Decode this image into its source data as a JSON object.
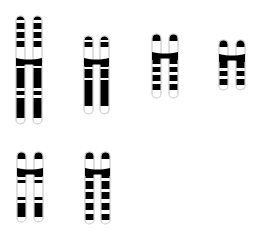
{
  "figure": {
    "background_color": "#ffffff",
    "band_color": "#000000",
    "outline_color": "#d8d8d8",
    "interband_color": "#ffffff",
    "canvas": {
      "width": 268,
      "height": 240
    },
    "rows": [
      {
        "name": "top-row",
        "count": 4
      },
      {
        "name": "bottom-row",
        "count": 2
      }
    ]
  },
  "chromosomes": [
    {
      "id": "chromosome-1",
      "name": "chromosome-1",
      "row": "top-row",
      "index": 1,
      "x": 16,
      "y": 16,
      "chromatid_width": 9,
      "gap": 8,
      "p_arm_length": 46,
      "q_arm_length": 62,
      "centromere_y": 62,
      "bands_p": [
        {
          "start": 0,
          "end": 4,
          "shade": "dark"
        },
        {
          "start": 4,
          "end": 7,
          "shade": "light"
        },
        {
          "start": 7,
          "end": 13,
          "shade": "dark"
        },
        {
          "start": 13,
          "end": 16,
          "shade": "light"
        },
        {
          "start": 16,
          "end": 22,
          "shade": "dark"
        },
        {
          "start": 22,
          "end": 25,
          "shade": "light"
        },
        {
          "start": 25,
          "end": 31,
          "shade": "dark"
        },
        {
          "start": 31,
          "end": 46,
          "shade": "light"
        }
      ],
      "bands_q": [
        {
          "start": 0,
          "end": 4,
          "shade": "dark"
        },
        {
          "start": 4,
          "end": 6,
          "shade": "light"
        },
        {
          "start": 6,
          "end": 26,
          "shade": "dark"
        },
        {
          "start": 26,
          "end": 29,
          "shade": "light"
        },
        {
          "start": 29,
          "end": 33,
          "shade": "dark"
        },
        {
          "start": 33,
          "end": 36,
          "shade": "light"
        },
        {
          "start": 36,
          "end": 56,
          "shade": "dark"
        },
        {
          "start": 56,
          "end": 62,
          "shade": "light"
        }
      ]
    },
    {
      "id": "chromosome-2",
      "name": "chromosome-2",
      "row": "top-row",
      "index": 2,
      "x": 84,
      "y": 36,
      "chromatid_width": 9,
      "gap": 7,
      "p_arm_length": 26,
      "q_arm_length": 52,
      "centromere_y": 62,
      "bands_p": [
        {
          "start": 0,
          "end": 4,
          "shade": "dark"
        },
        {
          "start": 4,
          "end": 6,
          "shade": "light"
        },
        {
          "start": 6,
          "end": 11,
          "shade": "dark"
        },
        {
          "start": 11,
          "end": 26,
          "shade": "light"
        }
      ],
      "bands_q": [
        {
          "start": 0,
          "end": 5,
          "shade": "dark"
        },
        {
          "start": 5,
          "end": 7,
          "shade": "light"
        },
        {
          "start": 7,
          "end": 16,
          "shade": "dark"
        },
        {
          "start": 16,
          "end": 18,
          "shade": "light"
        },
        {
          "start": 18,
          "end": 44,
          "shade": "dark"
        },
        {
          "start": 44,
          "end": 52,
          "shade": "light"
        }
      ]
    },
    {
      "id": "chromosome-3",
      "name": "chromosome-3",
      "row": "top-row",
      "index": 3,
      "x": 152,
      "y": 34,
      "chromatid_width": 9,
      "gap": 8,
      "p_arm_length": 22,
      "q_arm_length": 42,
      "centromere_y": 56,
      "bands_p": [
        {
          "start": 0,
          "end": 7,
          "shade": "dark"
        },
        {
          "start": 7,
          "end": 22,
          "shade": "light"
        }
      ],
      "bands_q": [
        {
          "start": 0,
          "end": 3,
          "shade": "light"
        },
        {
          "start": 3,
          "end": 8,
          "shade": "dark"
        },
        {
          "start": 8,
          "end": 11,
          "shade": "light"
        },
        {
          "start": 11,
          "end": 16,
          "shade": "dark"
        },
        {
          "start": 16,
          "end": 19,
          "shade": "light"
        },
        {
          "start": 19,
          "end": 25,
          "shade": "dark"
        },
        {
          "start": 25,
          "end": 28,
          "shade": "light"
        },
        {
          "start": 28,
          "end": 34,
          "shade": "dark"
        },
        {
          "start": 34,
          "end": 42,
          "shade": "light"
        }
      ]
    },
    {
      "id": "chromosome-4",
      "name": "chromosome-4",
      "row": "top-row",
      "index": 4,
      "x": 219,
      "y": 40,
      "chromatid_width": 9,
      "gap": 8,
      "p_arm_length": 18,
      "q_arm_length": 32,
      "centromere_y": 58,
      "bands_p": [
        {
          "start": 0,
          "end": 7,
          "shade": "dark"
        },
        {
          "start": 7,
          "end": 18,
          "shade": "light"
        }
      ],
      "bands_q": [
        {
          "start": 0,
          "end": 10,
          "shade": "dark"
        },
        {
          "start": 10,
          "end": 13,
          "shade": "light"
        },
        {
          "start": 13,
          "end": 18,
          "shade": "dark"
        },
        {
          "start": 18,
          "end": 21,
          "shade": "light"
        },
        {
          "start": 21,
          "end": 27,
          "shade": "dark"
        },
        {
          "start": 27,
          "end": 32,
          "shade": "light"
        }
      ]
    },
    {
      "id": "chromosome-5",
      "name": "chromosome-5",
      "row": "bottom-row",
      "index": 5,
      "x": 17,
      "y": 152,
      "chromatid_width": 9,
      "gap": 8,
      "p_arm_length": 20,
      "q_arm_length": 50,
      "centromere_y": 172,
      "bands_p": [
        {
          "start": 0,
          "end": 7,
          "shade": "dark"
        },
        {
          "start": 7,
          "end": 20,
          "shade": "light"
        }
      ],
      "bands_q": [
        {
          "start": 0,
          "end": 5,
          "shade": "dark"
        },
        {
          "start": 5,
          "end": 8,
          "shade": "light"
        },
        {
          "start": 8,
          "end": 11,
          "shade": "dark"
        },
        {
          "start": 11,
          "end": 25,
          "shade": "light"
        },
        {
          "start": 25,
          "end": 28,
          "shade": "dark"
        },
        {
          "start": 28,
          "end": 31,
          "shade": "light"
        },
        {
          "start": 31,
          "end": 45,
          "shade": "dark"
        },
        {
          "start": 45,
          "end": 50,
          "shade": "light"
        }
      ]
    },
    {
      "id": "chromosome-6",
      "name": "chromosome-6",
      "row": "bottom-row",
      "index": 6,
      "x": 85,
      "y": 152,
      "chromatid_width": 9,
      "gap": 7,
      "p_arm_length": 20,
      "q_arm_length": 52,
      "centromere_y": 172,
      "bands_p": [
        {
          "start": 0,
          "end": 7,
          "shade": "dark"
        },
        {
          "start": 7,
          "end": 20,
          "shade": "light"
        }
      ],
      "bands_q": [
        {
          "start": 0,
          "end": 6,
          "shade": "dark"
        },
        {
          "start": 6,
          "end": 9,
          "shade": "light"
        },
        {
          "start": 9,
          "end": 17,
          "shade": "dark"
        },
        {
          "start": 17,
          "end": 20,
          "shade": "light"
        },
        {
          "start": 20,
          "end": 27,
          "shade": "dark"
        },
        {
          "start": 27,
          "end": 31,
          "shade": "light"
        },
        {
          "start": 31,
          "end": 38,
          "shade": "dark"
        },
        {
          "start": 38,
          "end": 42,
          "shade": "light"
        },
        {
          "start": 42,
          "end": 48,
          "shade": "dark"
        },
        {
          "start": 48,
          "end": 52,
          "shade": "light"
        }
      ]
    }
  ]
}
